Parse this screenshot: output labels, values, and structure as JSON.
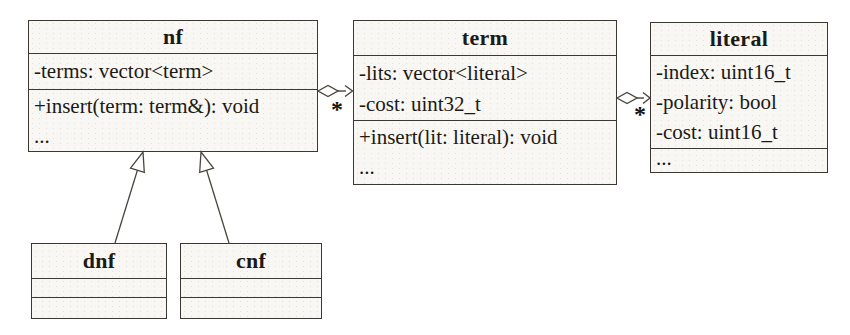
{
  "diagram": {
    "type": "uml-class-diagram",
    "background_color": "#ffffff",
    "box_fill_color": "#f8f7f3",
    "border_color": "#3b3834",
    "classes": [
      {
        "name": "nf",
        "attributes": [
          "-terms: vector<term>"
        ],
        "methods": [
          "+insert(term: term&): void",
          "..."
        ]
      },
      {
        "name": "term",
        "attributes": [
          "-lits: vector<literal>",
          "-cost: uint32_t"
        ],
        "methods": [
          "+insert(lit: literal): void",
          "..."
        ]
      },
      {
        "name": "literal",
        "attributes": [
          "-index: uint16_t",
          "-polarity: bool",
          "-cost: uint16_t"
        ],
        "methods": [
          "..."
        ]
      },
      {
        "name": "dnf",
        "attributes": [],
        "methods": []
      },
      {
        "name": "cnf",
        "attributes": [],
        "methods": []
      }
    ],
    "relationships": [
      {
        "type": "aggregation",
        "from": "nf",
        "to": "term",
        "multiplicity": "*"
      },
      {
        "type": "aggregation",
        "from": "term",
        "to": "literal",
        "multiplicity": "*"
      },
      {
        "type": "inheritance",
        "from": "dnf",
        "to": "nf"
      },
      {
        "type": "inheritance",
        "from": "cnf",
        "to": "nf"
      }
    ]
  }
}
